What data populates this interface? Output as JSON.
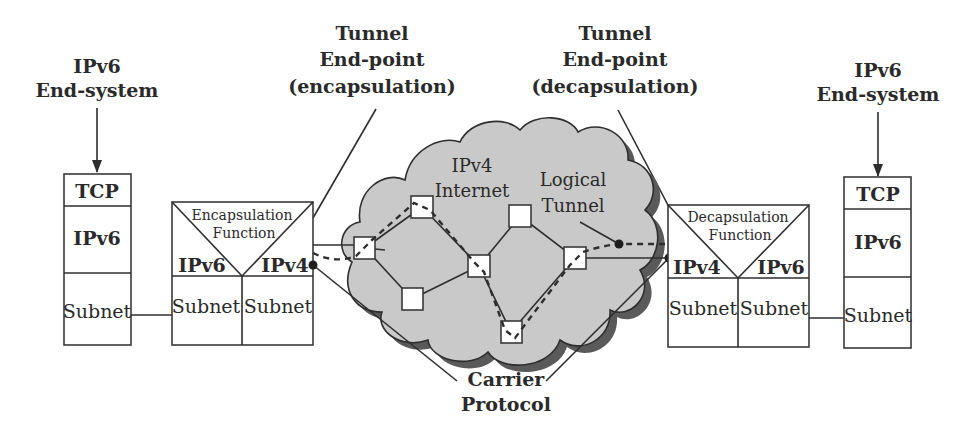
{
  "diagram": {
    "colors": {
      "cloud_fill": "#c9c9c9",
      "cloud_shadow": "#5a5a5a",
      "line": "#2e2e2e",
      "box_fill": "#ffffff"
    },
    "left_end_system": {
      "label_line1": "IPv6",
      "label_line2": "End-system",
      "layers": [
        "TCP",
        "IPv6",
        "Subnet"
      ]
    },
    "right_end_system": {
      "label_line1": "IPv6",
      "label_line2": "End-system",
      "layers": [
        "TCP",
        "IPv6",
        "Subnet"
      ]
    },
    "encap_endpoint": {
      "label_line1": "Tunnel",
      "label_line2": "End-point",
      "label_line3": "(encapsulation)",
      "function_line1": "Encapsulation",
      "function_line2": "Function",
      "left_proto": "IPv6",
      "right_proto": "IPv4",
      "left_subnet": "Subnet",
      "right_subnet": "Subnet"
    },
    "decap_endpoint": {
      "label_line1": "Tunnel",
      "label_line2": "End-point",
      "label_line3": "(decapsulation)",
      "function_line1": "Decapsulation",
      "function_line2": "Function",
      "left_proto": "IPv4",
      "right_proto": "IPv6",
      "left_subnet": "Subnet",
      "right_subnet": "Subnet"
    },
    "cloud": {
      "label_line1": "IPv4",
      "label_line2": "Internet",
      "tunnel_line1": "Logical",
      "tunnel_line2": "Tunnel",
      "router_count": 7
    },
    "carrier": {
      "label_line1": "Carrier",
      "label_line2": "Protocol"
    }
  }
}
